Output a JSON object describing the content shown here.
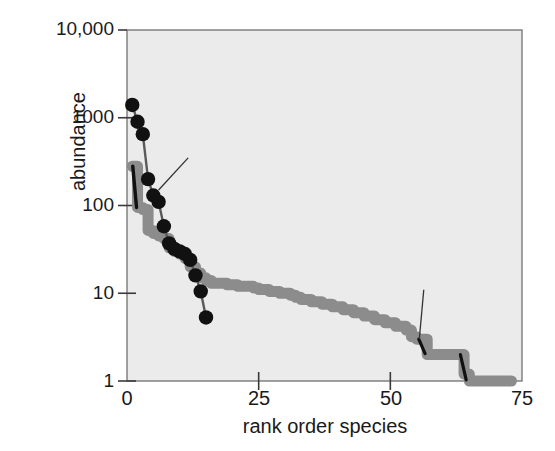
{
  "chart_data": {
    "type": "line",
    "title": "",
    "subtitle": "",
    "xlabel": "rank order species",
    "ylabel": "abundance",
    "xlim": [
      0,
      75
    ],
    "ylim": [
      1,
      10000
    ],
    "yscale": "log",
    "grid": false,
    "legend_position": "inline-annotations",
    "xticks": [
      "0",
      "25",
      "50",
      "75"
    ],
    "xtick_values": [
      0,
      25,
      50,
      75
    ],
    "yticks": [
      "1",
      "10",
      "100",
      "1000",
      "10,000"
    ],
    "ytick_values": [
      1,
      10,
      100,
      1000,
      10000
    ],
    "annotations": [
      {
        "label": "Ordovician",
        "series": "Ordovician",
        "x_text": 8.5,
        "y_text": 430,
        "points_to": [
          6.0,
          150
        ]
      },
      {
        "label": "Pleistocene",
        "series": "Pleistocene",
        "x_text": 53.0,
        "y_text": 13.5,
        "points_to": [
          55.5,
          3.0
        ]
      }
    ],
    "series": [
      {
        "name": "Ordovician",
        "color": "#111111",
        "marker": "filled-circle",
        "x": [
          1,
          2,
          3,
          4,
          5,
          6,
          7,
          8,
          9,
          10,
          11,
          12,
          13,
          14,
          15
        ],
        "values": [
          1400,
          900,
          650,
          200,
          130,
          110,
          58,
          37,
          32,
          30,
          28,
          24,
          16,
          10.5,
          5.3
        ]
      },
      {
        "name": "Pleistocene",
        "color": "#8c8c8c",
        "marker": "thick-step-line",
        "x": [
          1,
          2,
          3,
          4,
          5,
          6,
          7,
          8,
          9,
          10,
          11,
          12,
          13,
          14,
          15,
          16,
          17,
          18,
          19,
          20,
          21,
          22,
          23,
          24,
          25,
          26,
          27,
          28,
          29,
          30,
          31,
          32,
          33,
          34,
          35,
          36,
          37,
          38,
          39,
          40,
          41,
          42,
          43,
          44,
          45,
          46,
          47,
          48,
          49,
          50,
          51,
          52,
          53,
          54,
          55,
          56,
          57,
          58,
          59,
          60,
          61,
          62,
          63,
          64,
          65,
          66,
          67,
          68,
          69,
          70,
          71,
          72,
          73
        ],
        "values": [
          280,
          95,
          90,
          52,
          48,
          45,
          42,
          33,
          30,
          28,
          25,
          20,
          17,
          15,
          14,
          13,
          13,
          13,
          12.5,
          12.5,
          12,
          12,
          12,
          11.5,
          11,
          11,
          10.5,
          10.5,
          10,
          10,
          9.5,
          9,
          8.5,
          8.5,
          8,
          8,
          7.5,
          7.5,
          7,
          7,
          6.5,
          6.5,
          6,
          6,
          5.5,
          5.5,
          5,
          5,
          4.6,
          4.6,
          4.2,
          4.2,
          3.8,
          3.2,
          3.0,
          3.0,
          2.0,
          2.0,
          2.0,
          2.0,
          2.0,
          2.0,
          2.0,
          1.2,
          1.0,
          1.0,
          1.0,
          1.0,
          1.0,
          1.0,
          1.0,
          1.0,
          1.0
        ]
      }
    ],
    "colors": {
      "ordovician": "#111111",
      "pleistocene": "#8c8c8c",
      "panel_background": "#ebebeb",
      "frame": "#777777",
      "text": "#1a1a1a"
    }
  }
}
